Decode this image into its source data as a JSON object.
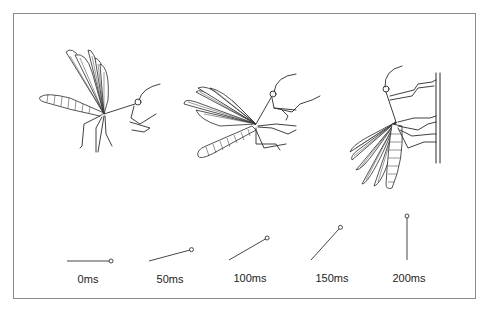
{
  "figure": {
    "frames": [
      {
        "label": "0ms",
        "angle_deg": 0
      },
      {
        "label": "50ms",
        "angle_deg": 15
      },
      {
        "label": "100ms",
        "angle_deg": 30
      },
      {
        "label": "150ms",
        "angle_deg": 48
      },
      {
        "label": "200ms",
        "angle_deg": 90
      }
    ],
    "illustrations": [
      {
        "name": "insect-in-flight",
        "stage": "approach"
      },
      {
        "name": "insect-pitching-up",
        "stage": "pitch-up"
      },
      {
        "name": "insect-landed-on-wall",
        "stage": "landed"
      }
    ],
    "colors": {
      "ink": "#2a2a2a",
      "frame": "#8a8a8a",
      "background": "#ffffff"
    }
  }
}
